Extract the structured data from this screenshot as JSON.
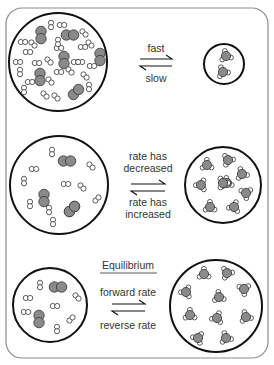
{
  "diagram": {
    "colors": {
      "frame": "#8c8c8c",
      "circle": "#111111",
      "large_atom": "#8a8a8a",
      "small_atom": "#ffffff",
      "atom_stroke": "#333333",
      "text": "#333333"
    },
    "panels": [
      {
        "id": "start",
        "arrow_top_label": "fast",
        "arrow_bottom_label": "slow",
        "heading": "",
        "reactants": {
          "large_pairs": 8,
          "small_pairs": 26
        },
        "products": {
          "molecules": 2
        }
      },
      {
        "id": "middle",
        "arrow_top_label_line1": "rate has",
        "arrow_top_label_line2": "decreased",
        "arrow_bottom_label_line1": "rate has",
        "arrow_bottom_label_line2": "increased",
        "heading": "",
        "reactants": {
          "large_pairs": 4,
          "small_pairs": 10
        },
        "products": {
          "molecules": 9
        }
      },
      {
        "id": "equilibrium",
        "heading": "Equilibrium",
        "arrow_top_label": "forward rate",
        "arrow_bottom_label": "reverse rate",
        "reactants": {
          "large_pairs": 2,
          "small_pairs": 7
        },
        "products": {
          "molecules": 10
        }
      }
    ]
  }
}
